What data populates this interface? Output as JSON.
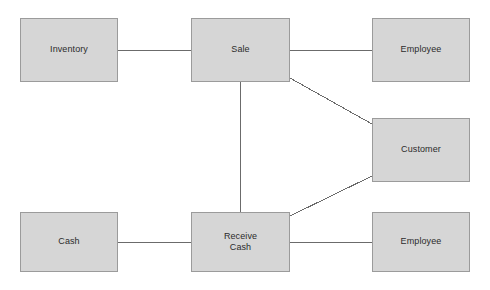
{
  "diagram": {
    "type": "entity-relationship",
    "background_color": "#ffffff",
    "box_fill_color": "#d6d6d6",
    "box_border_color": "#9b9b9b",
    "edge_color": "#6b6b6b",
    "text_color": "#2b2b2b",
    "nodes": [
      {
        "id": "inventory",
        "label": "Inventory",
        "x": 20,
        "y": 18,
        "w": 98,
        "h": 64
      },
      {
        "id": "sale",
        "label": "Sale",
        "x": 191,
        "y": 18,
        "w": 99,
        "h": 64
      },
      {
        "id": "employee_top",
        "label": "Employee",
        "x": 372,
        "y": 18,
        "w": 98,
        "h": 64
      },
      {
        "id": "customer",
        "label": "Customer",
        "x": 372,
        "y": 118,
        "w": 98,
        "h": 64
      },
      {
        "id": "cash",
        "label": "Cash",
        "x": 20,
        "y": 212,
        "w": 98,
        "h": 60
      },
      {
        "id": "receive_cash",
        "label": "Receive\nCash",
        "x": 191,
        "y": 212,
        "w": 99,
        "h": 60
      },
      {
        "id": "employee_bottom",
        "label": "Employee",
        "x": 372,
        "y": 212,
        "w": 98,
        "h": 60
      }
    ],
    "edges": [
      {
        "id": "inventory-sale",
        "from": "inventory",
        "to": "sale",
        "x1": 118,
        "y1": 50,
        "x2": 191,
        "y2": 50
      },
      {
        "id": "sale-employee-top",
        "from": "sale",
        "to": "employee_top",
        "x1": 290,
        "y1": 50,
        "x2": 372,
        "y2": 50
      },
      {
        "id": "sale-receive-cash",
        "from": "sale",
        "to": "receive_cash",
        "x1": 240,
        "y1": 82,
        "x2": 240,
        "y2": 212
      },
      {
        "id": "sale-customer",
        "from": "sale",
        "to": "customer",
        "x1": 290,
        "y1": 78,
        "x2": 372,
        "y2": 124
      },
      {
        "id": "receive-cash-customer",
        "from": "receive_cash",
        "to": "customer",
        "x1": 290,
        "y1": 216,
        "x2": 372,
        "y2": 176
      },
      {
        "id": "cash-receive-cash",
        "from": "cash",
        "to": "receive_cash",
        "x1": 118,
        "y1": 242,
        "x2": 191,
        "y2": 242
      },
      {
        "id": "receive-cash-employee-bottom",
        "from": "receive_cash",
        "to": "employee_bottom",
        "x1": 290,
        "y1": 242,
        "x2": 372,
        "y2": 242
      }
    ]
  }
}
